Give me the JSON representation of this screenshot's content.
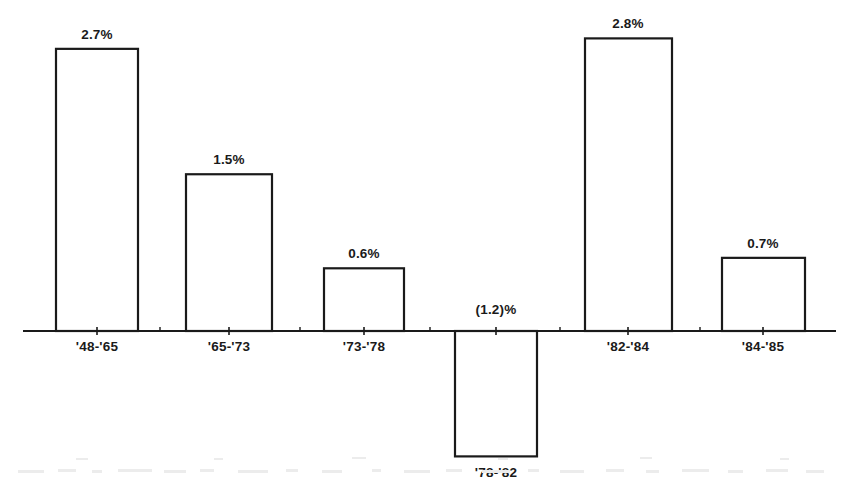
{
  "chart_data": {
    "type": "bar",
    "title": "",
    "subtitle": "",
    "xlabel": "",
    "ylabel": "",
    "categories": [
      "'48-'65",
      "'65-'73",
      "'73-'78",
      "'78-'82",
      "'82-'84",
      "'84-'85"
    ],
    "values": [
      2.7,
      1.5,
      0.6,
      -1.2,
      2.8,
      0.7
    ],
    "value_labels": [
      "2.7%",
      "1.5%",
      "0.6%",
      "(1.2)%",
      "2.8%",
      "0.7%"
    ],
    "ylim": [
      -1.2,
      2.8
    ],
    "grid": false,
    "legend": null,
    "legend_position": "none",
    "axis_note": "single horizontal zero baseline; no y-axis ticks or numeric scale shown",
    "bar_style": "unfilled outline, black stroke, white fill",
    "negative_label_position": "above baseline",
    "negative_category_position": "below bar"
  },
  "colors": {
    "background": "#ffffff",
    "stroke": "#1a1a1a",
    "bar_fill": "#ffffff",
    "text": "#1a1a1a",
    "noise": "#e8e8e8"
  },
  "geometry": {
    "width": 844,
    "height": 486,
    "baseline_y": 331,
    "axis_x_start": 23,
    "axis_x_end": 836,
    "px_per_percent": 104.5,
    "bars": [
      {
        "x0": 56,
        "x1": 138,
        "center": 97
      },
      {
        "x0": 186,
        "x1": 272,
        "center": 229
      },
      {
        "x0": 324,
        "x1": 404,
        "center": 364
      },
      {
        "x0": 455,
        "x1": 537,
        "center": 496
      },
      {
        "x0": 585,
        "x1": 672,
        "center": 628
      },
      {
        "x0": 722,
        "x1": 805,
        "center": 763
      }
    ],
    "tick_centers": [
      97,
      229,
      364,
      496,
      628,
      763
    ]
  }
}
